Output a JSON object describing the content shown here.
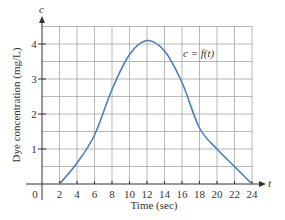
{
  "chart_data": {
    "type": "line",
    "title": "",
    "xlabel": "Time (sec)",
    "ylabel": "Dye concentration (mg/L)",
    "x_axis_var": "t",
    "y_axis_var": "c",
    "xlim": [
      0,
      24
    ],
    "ylim": [
      0,
      4.5
    ],
    "x_ticks": [
      0,
      2,
      4,
      6,
      8,
      10,
      12,
      14,
      16,
      18,
      20,
      22,
      24
    ],
    "y_ticks": [
      1,
      2,
      3,
      4
    ],
    "grid": true,
    "grid_x_step": 2,
    "grid_y_step": 0.5,
    "annotation": "c = f(t)",
    "series": [
      {
        "name": "c = f(t)",
        "color": "#4a7fc1",
        "x": [
          2,
          4,
          6,
          8,
          10,
          12,
          14,
          16,
          18,
          20,
          22,
          24
        ],
        "values": [
          0,
          0.6,
          1.4,
          2.7,
          3.7,
          4.1,
          3.8,
          2.9,
          1.6,
          1.0,
          0.5,
          0
        ]
      }
    ]
  },
  "labels": {
    "origin": "0",
    "x_title": "Time (sec)",
    "y_title": "Dye concentration (mg/L)",
    "x_var": "t",
    "y_var": "c",
    "curve_label": "c = f(t)"
  }
}
